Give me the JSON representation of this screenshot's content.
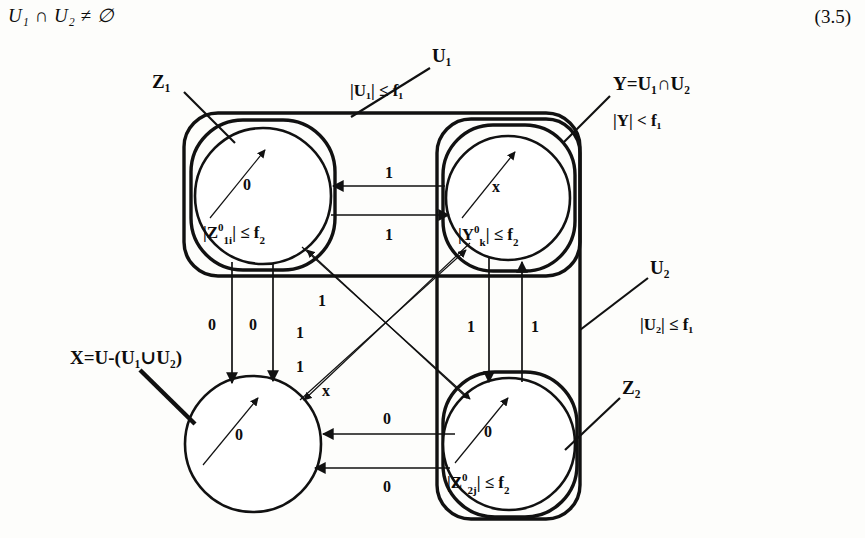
{
  "formula": {
    "text": "U₁ ∩ U₂ ≠ ∅",
    "equation_number": "(3.5)"
  },
  "groups": [
    {
      "id": "z1",
      "label": "Z₁"
    },
    {
      "id": "u1",
      "label": "U₁",
      "constraint": "|U₁| ≤ f₁"
    },
    {
      "id": "y",
      "label": "Y=U₁∩U₂",
      "constraint": "|Y| < f₁"
    },
    {
      "id": "u2",
      "label": "U₂",
      "constraint": "|U₂| ≤ f₁"
    },
    {
      "id": "z2",
      "label": "Z₂"
    },
    {
      "id": "x",
      "label": "X=U-(U₁∪U₂)"
    }
  ],
  "nodes": [
    {
      "id": "z1",
      "text_prefix": "|Z",
      "text_sup": "0",
      "text_sub": "1i",
      "text_suffix": "| ≤ f",
      "text_suffix_sub": "2",
      "self_label": "0"
    },
    {
      "id": "y",
      "text_prefix": "|Y",
      "text_sup": "0",
      "text_sub": "k",
      "text_suffix": "| ≤ f",
      "text_suffix_sub": "2",
      "self_label": "x"
    },
    {
      "id": "x",
      "text_prefix": "",
      "text_sup": "",
      "text_sub": "",
      "text_suffix": "",
      "text_suffix_sub": "",
      "self_label": "0"
    },
    {
      "id": "z2",
      "text_prefix": "|Z",
      "text_sup": "0",
      "text_sub": "2j",
      "text_suffix": "| ≤ f",
      "text_suffix_sub": "2",
      "self_label": "0"
    }
  ],
  "edge_labels": {
    "y_to_z1": "1",
    "z1_to_y": "1",
    "z1_to_x_a": "0",
    "z1_to_x_b": "0",
    "diag_1": "1",
    "diag_2": "1",
    "diag_3": "1",
    "diag_x": "x",
    "y_to_z2": "1",
    "z2_to_y": "1",
    "z2_to_x_a": "0",
    "z2_to_x_b": "0"
  },
  "colors": {
    "ink": "#111111",
    "paper": "#fdfdfb"
  }
}
